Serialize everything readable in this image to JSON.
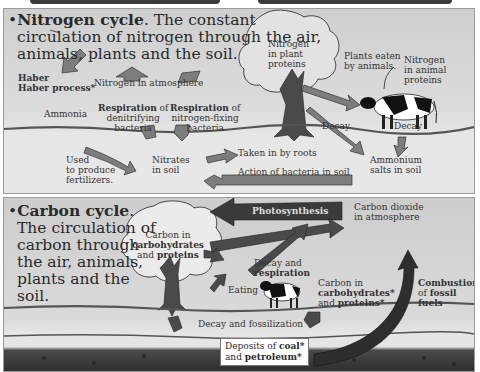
{
  "nitrogen_cycle": {
    "title_bold": "Nitrogen cycle",
    "title_rest": ". The constant circulation of nitrogen through the air, animals, plants and the soil.",
    "title_lines": [
      "Nitrogen cycle",
      ". The constant",
      "circulation of nitrogen through the air,",
      "animals, plants and the soil."
    ],
    "labels": {
      "haber_process": "Haber process*",
      "nitrogen_atmosphere": "Nitrogen in atmosphere",
      "ammonia": "Ammonia",
      "resp_denitrifying_bold": "Respiration",
      "resp_denitrifying_rest_1": " of",
      "resp_denitrifying_rest_2": "denitrifying",
      "resp_denitrifying_rest_3": "bacteria",
      "resp_fixing_bold": "Respiration",
      "resp_fixing_rest_1": " of",
      "resp_fixing_rest_2": "nitrogen-fixing",
      "resp_fixing_rest_3": "bacteria",
      "plant_proteins_1": "Nitrogen",
      "plant_proteins_2": "in plant",
      "plant_proteins_3": "proteins",
      "plants_eaten_1": "Plants eaten",
      "plants_eaten_2": "by animals.",
      "animal_proteins_1": "Nitrogen",
      "animal_proteins_2": "in animal",
      "animal_proteins_3": "proteins",
      "decay_1": "Decay",
      "decay_2": "Decay",
      "fertilizers_1": "Used",
      "fertilizers_2": "to produce",
      "fertilizers_3": "fertilizers.",
      "nitrates_1": "Nitrates",
      "nitrates_2": "in soil",
      "taken_by_roots": "Taken in by roots",
      "action_bacteria": "Action of bacteria in soil",
      "ammonium_1": "Ammonium",
      "ammonium_2": "salts in soil"
    }
  },
  "carbon_cycle": {
    "title_lines": [
      "Carbon cycle",
      ".",
      "The circulation of",
      "carbon through",
      "the air, animals,",
      "plants and the",
      "soil."
    ],
    "labels": {
      "tree_carbon_1": "Carbon in",
      "tree_carbon_2": "carbohydrates",
      "tree_carbon_3_pre": "and ",
      "tree_carbon_3_bold": "proteins",
      "photosynthesis": "Photosynthesis",
      "co2_1": "Carbon dioxide",
      "co2_2": "in atmosphere",
      "decay_resp_1": "Decay and",
      "decay_resp_2": "respiration",
      "eating": "Eating",
      "animal_carbon_1": "Carbon in",
      "animal_carbon_2": "carbohydrates*",
      "animal_carbon_3_pre": "and ",
      "animal_carbon_3_bold": "proteins*",
      "combustion_1": "Combustion",
      "combustion_2_pre": "of ",
      "combustion_2_bold": "fossil",
      "combustion_3": "fuels",
      "decay_fossil": "Decay and fossilization",
      "deposits_1_pre": "Deposits of ",
      "deposits_1_bold": "coal*",
      "deposits_2_pre": "and ",
      "deposits_2_bold": "petroleum*"
    }
  },
  "colors": {
    "panel_bg": "#d9d9d9",
    "arrow_fill": "#7d7d7d",
    "arrow_dark": "#3a3a3a",
    "soil_dark": "#2e2e2e"
  }
}
